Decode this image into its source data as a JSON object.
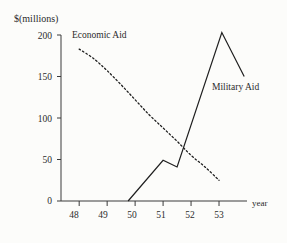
{
  "chart_data": {
    "type": "line",
    "title": "",
    "xlabel": "year",
    "ylabel": "$(millions)",
    "xlim": [
      47.35,
      54.0
    ],
    "ylim": [
      0,
      200
    ],
    "grid": false,
    "legend_position": "inline-annotations",
    "xticks": [
      "48",
      "49",
      "50",
      "51",
      "52",
      "53"
    ],
    "xtick_values": [
      48,
      49,
      50,
      51,
      52,
      53
    ],
    "yticks": [
      "0",
      "50",
      "100",
      "150",
      "200"
    ],
    "ytick_values": [
      0,
      50,
      100,
      150,
      200
    ],
    "series": [
      {
        "name": "Economic Aid",
        "style": "dashed",
        "x": [
          48.0,
          48.5,
          49.0,
          49.5,
          50.0,
          50.5,
          51.0,
          51.5,
          52.0,
          52.5,
          53.0
        ],
        "values": [
          183,
          172,
          157,
          140,
          122,
          104,
          88,
          72,
          55,
          41,
          25
        ]
      },
      {
        "name": "Military Aid",
        "style": "solid",
        "x": [
          49.75,
          51.0,
          51.5,
          53.1,
          53.9
        ],
        "values": [
          0,
          49,
          41,
          203,
          150
        ]
      }
    ],
    "annotations": [
      {
        "text": "Economic Aid",
        "series": "Economic Aid"
      },
      {
        "text": "Military Aid",
        "series": "Military Aid"
      }
    ],
    "axis_color": "#3a3a3a",
    "line_color": "#1f1f1f",
    "background_color": "#fcfcfa"
  }
}
